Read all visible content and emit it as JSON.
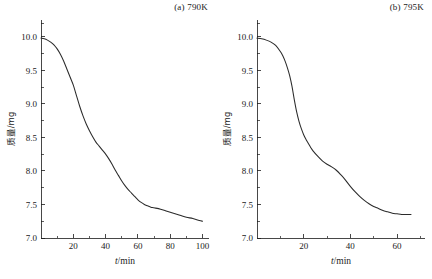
{
  "figure": {
    "panels": [
      {
        "id": "panel-a",
        "title": "(a) 790K",
        "xlabel_var": "t",
        "xlabel_unit": "/min",
        "ylabel": "质量/mg"
      },
      {
        "id": "panel-b",
        "title": "(b) 795K",
        "xlabel_var": "t",
        "xlabel_unit": "/min",
        "ylabel": "质量/mg"
      }
    ]
  },
  "chart_data": [
    {
      "type": "line",
      "title": "(a) 790K",
      "xlabel": "t/min",
      "ylabel": "质量/mg",
      "xlim": [
        0,
        104
      ],
      "ylim": [
        7.0,
        10.25
      ],
      "xticks": [
        0,
        20,
        40,
        60,
        80,
        100
      ],
      "xtick_labels": [
        "",
        "20",
        "40",
        "60",
        "80",
        "100"
      ],
      "xticks_minor": [
        10,
        30,
        50,
        70,
        90
      ],
      "yticks": [
        7.0,
        7.5,
        8.0,
        8.5,
        9.0,
        9.5,
        10.0
      ],
      "ytick_labels": [
        "7.0",
        "7.5",
        "8.0",
        "8.5",
        "9.0",
        "9.5",
        "10.0"
      ],
      "grid": false,
      "legend": "none",
      "series": [
        {
          "name": "790K mass loss",
          "x": [
            0,
            2,
            4,
            6,
            8,
            10,
            12,
            14,
            16,
            18,
            20,
            22,
            24,
            26,
            28,
            30,
            32,
            34,
            36,
            38,
            40,
            42,
            44,
            46,
            48,
            50,
            52,
            54,
            56,
            58,
            60,
            62,
            64,
            66,
            68,
            70,
            74,
            78,
            82,
            86,
            90,
            94,
            98,
            100
          ],
          "y": [
            9.98,
            9.97,
            9.95,
            9.92,
            9.88,
            9.82,
            9.74,
            9.64,
            9.52,
            9.4,
            9.28,
            9.12,
            8.96,
            8.82,
            8.7,
            8.6,
            8.51,
            8.43,
            8.37,
            8.31,
            8.25,
            8.18,
            8.1,
            8.01,
            7.93,
            7.85,
            7.78,
            7.72,
            7.67,
            7.62,
            7.57,
            7.53,
            7.5,
            7.48,
            7.46,
            7.45,
            7.43,
            7.4,
            7.37,
            7.34,
            7.31,
            7.29,
            7.26,
            7.25
          ]
        }
      ]
    },
    {
      "type": "line",
      "title": "(b) 795K",
      "xlabel": "t/min",
      "ylabel": "质量/mg",
      "xlim": [
        0,
        72
      ],
      "ylim": [
        7.0,
        10.25
      ],
      "xticks": [
        0,
        20,
        40,
        60
      ],
      "xtick_labels": [
        "",
        "20",
        "40",
        "60"
      ],
      "xticks_minor": [
        10,
        30,
        50,
        70
      ],
      "yticks": [
        7.0,
        7.5,
        8.0,
        8.5,
        9.0,
        9.5,
        10.0
      ],
      "ytick_labels": [
        "7.0",
        "7.5",
        "8.0",
        "8.5",
        "9.0",
        "9.5",
        "10.0"
      ],
      "grid": false,
      "legend": "none",
      "series": [
        {
          "name": "795K mass loss",
          "x": [
            0,
            2,
            4,
            6,
            8,
            10,
            11,
            12,
            13,
            14,
            15,
            16,
            17,
            18,
            19,
            20,
            21,
            22,
            23,
            24,
            26,
            28,
            30,
            32,
            34,
            36,
            38,
            40,
            42,
            44,
            46,
            48,
            50,
            52,
            54,
            56,
            58,
            60,
            62,
            64,
            66
          ],
          "y": [
            9.98,
            9.97,
            9.95,
            9.92,
            9.87,
            9.78,
            9.72,
            9.64,
            9.54,
            9.42,
            9.26,
            9.06,
            8.88,
            8.74,
            8.63,
            8.54,
            8.47,
            8.41,
            8.35,
            8.3,
            8.22,
            8.15,
            8.1,
            8.06,
            8.01,
            7.94,
            7.86,
            7.77,
            7.69,
            7.62,
            7.56,
            7.51,
            7.47,
            7.44,
            7.41,
            7.39,
            7.37,
            7.36,
            7.35,
            7.35,
            7.35
          ]
        }
      ]
    }
  ]
}
